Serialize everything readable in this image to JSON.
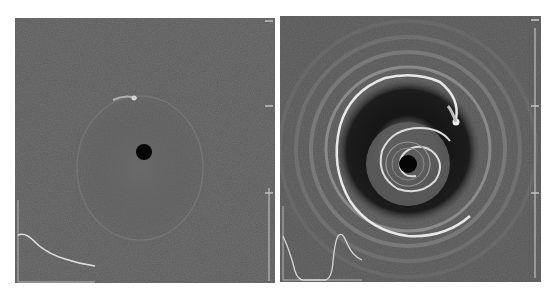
{
  "figure": {
    "panels": [
      {
        "id": "left",
        "description": "Disk surface density map, early time: faint elliptical ring with planet-induced bright arc",
        "background_color": "#5a5a5a",
        "star_color": "#050505",
        "inset_profile": "monotonic decreasing radial profile"
      },
      {
        "id": "right",
        "description": "Disk surface density map, later time: concentric rings, dark gap, and inner spiral",
        "background_color": "#555555",
        "gap_color": "#151515",
        "star_color": "#050505",
        "inset_profile": "gap then peak radial profile"
      }
    ]
  }
}
